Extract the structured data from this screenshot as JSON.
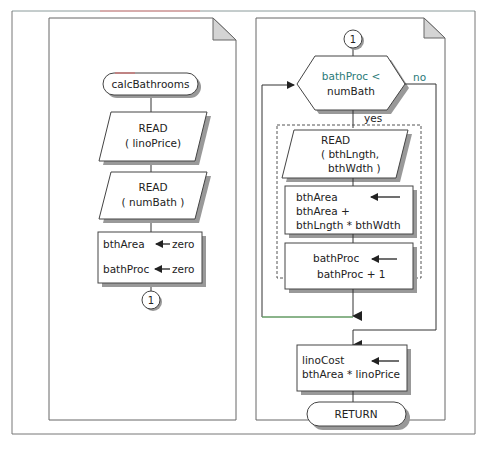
{
  "diagram": {
    "type": "flowchart",
    "left_page": {
      "start_label": "calcBathrooms",
      "read1": {
        "line1": "READ",
        "line2": "( linoPrice)"
      },
      "read2": {
        "line1": "READ",
        "line2": "( numBath )"
      },
      "assign": {
        "row1_target": "bthArea",
        "row1_value": "zero",
        "row2_target": "bathProc",
        "row2_value": "zero"
      },
      "connector": "1"
    },
    "right_page": {
      "connector": "1",
      "decision": {
        "line1": "bathProc <",
        "line2": "numBath"
      },
      "no_label": "no",
      "yes_label": "yes",
      "read": {
        "line1": "READ",
        "line2": "( bthLngth,",
        "line3": "bthWdth )"
      },
      "assign_area": {
        "line1": "bthArea",
        "line2": "bthArea  +",
        "line3": "bthLngth * bthWdth"
      },
      "assign_proc": {
        "line1": "bathProc",
        "line2": "bathProc  + 1"
      },
      "assign_cost": {
        "line1": "linoCost",
        "line2": "bthArea  * linoPrice"
      },
      "end_label": "RETURN"
    },
    "colors": {
      "line": "#333333",
      "page_border": "#666666",
      "shadow": "#9a9a9a",
      "fold": "#d4d4d4",
      "decision_text": "#2a7a78",
      "loop_line_green": "#7ccf7c"
    }
  }
}
